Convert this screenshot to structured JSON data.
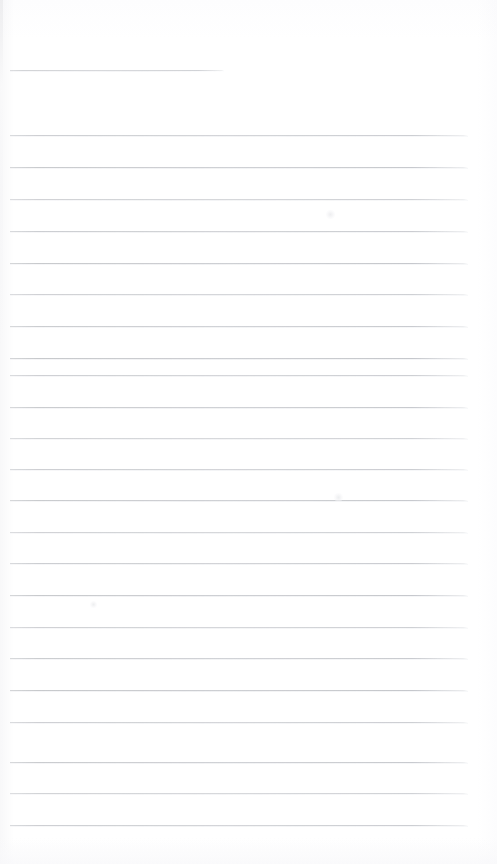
{
  "document": {
    "kind": "scanned-lined-notepad-page",
    "title": "",
    "body_text": "",
    "visible_text": "",
    "page_width": 497,
    "page_height": 864,
    "background_color": "#fefefe",
    "rule_color": "#cdd0d4",
    "rule_thickness": 1
  },
  "ruled_lines": {
    "count": 25,
    "left_x": 10,
    "right_x": 468,
    "spacing": 31.5,
    "items": [
      {
        "index": 1,
        "y": 70,
        "left": 10,
        "right": 224,
        "length": 214,
        "variant": "short"
      },
      {
        "index": 2,
        "y": 135,
        "left": 10,
        "right": 468,
        "length": 458,
        "variant": "full"
      },
      {
        "index": 3,
        "y": 167,
        "left": 10,
        "right": 468,
        "length": 458,
        "variant": "full"
      },
      {
        "index": 4,
        "y": 199,
        "left": 10,
        "right": 468,
        "length": 458,
        "variant": "full"
      },
      {
        "index": 5,
        "y": 231,
        "left": 10,
        "right": 468,
        "length": 458,
        "variant": "full"
      },
      {
        "index": 6,
        "y": 263,
        "left": 10,
        "right": 468,
        "length": 458,
        "variant": "full"
      },
      {
        "index": 7,
        "y": 294,
        "left": 10,
        "right": 468,
        "length": 458,
        "variant": "full"
      },
      {
        "index": 8,
        "y": 326,
        "left": 10,
        "right": 468,
        "length": 458,
        "variant": "full"
      },
      {
        "index": 9,
        "y": 358,
        "left": 10,
        "right": 468,
        "length": 458,
        "variant": "full"
      },
      {
        "index": 10,
        "y": 375,
        "left": 10,
        "right": 468,
        "length": 458,
        "variant": "full"
      },
      {
        "index": 11,
        "y": 407,
        "left": 10,
        "right": 468,
        "length": 458,
        "variant": "full"
      },
      {
        "index": 12,
        "y": 438,
        "left": 10,
        "right": 468,
        "length": 458,
        "variant": "full"
      },
      {
        "index": 13,
        "y": 469,
        "left": 10,
        "right": 468,
        "length": 458,
        "variant": "full"
      },
      {
        "index": 14,
        "y": 500,
        "left": 10,
        "right": 468,
        "length": 458,
        "variant": "full"
      },
      {
        "index": 15,
        "y": 532,
        "left": 10,
        "right": 468,
        "length": 458,
        "variant": "full"
      },
      {
        "index": 16,
        "y": 563,
        "left": 10,
        "right": 468,
        "length": 458,
        "variant": "full"
      },
      {
        "index": 17,
        "y": 595,
        "left": 10,
        "right": 468,
        "length": 458,
        "variant": "full"
      },
      {
        "index": 18,
        "y": 627,
        "left": 10,
        "right": 468,
        "length": 458,
        "variant": "full"
      },
      {
        "index": 19,
        "y": 658,
        "left": 10,
        "right": 468,
        "length": 458,
        "variant": "full"
      },
      {
        "index": 20,
        "y": 690,
        "left": 10,
        "right": 468,
        "length": 458,
        "variant": "full"
      },
      {
        "index": 21,
        "y": 722,
        "left": 10,
        "right": 468,
        "length": 458,
        "variant": "full"
      },
      {
        "index": 22,
        "y": 762,
        "left": 10,
        "right": 468,
        "length": 458,
        "variant": "full"
      },
      {
        "index": 23,
        "y": 793,
        "left": 10,
        "right": 468,
        "length": 458,
        "variant": "full"
      },
      {
        "index": 24,
        "y": 825,
        "left": 10,
        "right": 468,
        "length": 458,
        "variant": "full"
      }
    ]
  },
  "smudges": [
    {
      "x": 330,
      "y": 214,
      "size": 9
    },
    {
      "x": 338,
      "y": 497,
      "size": 9
    },
    {
      "x": 93,
      "y": 604,
      "size": 7
    }
  ]
}
